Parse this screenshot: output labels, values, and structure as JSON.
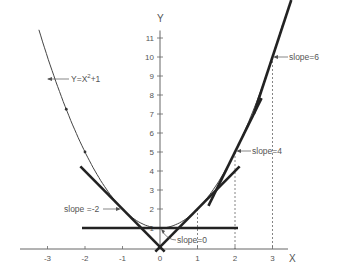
{
  "chart_data": {
    "type": "line",
    "title": "",
    "xlabel": "X",
    "ylabel": "Y",
    "function": "Y=X^2+1",
    "curve_label": "Y=X2+1",
    "xlim": [
      -3.5,
      3.8
    ],
    "ylim": [
      0,
      11.5
    ],
    "x_ticks": [
      -3,
      -2,
      -1,
      0,
      1,
      2,
      3
    ],
    "x_tick_labels": [
      "-3",
      "-2",
      "-1",
      "0",
      "1",
      "2",
      "3"
    ],
    "y_ticks": [
      1,
      2,
      3,
      4,
      5,
      6,
      7,
      8,
      9,
      10,
      11
    ],
    "y_tick_labels": [
      "1",
      "2",
      "3",
      "4",
      "5",
      "6",
      "7",
      "8",
      "9",
      "10",
      "11"
    ],
    "grid": false,
    "series": [
      {
        "name": "Y=X^2+1",
        "x": [
          -3,
          -2.5,
          -2,
          -1.5,
          -1,
          -0.5,
          0,
          0.5,
          1,
          1.5,
          2,
          2.5,
          3
        ],
        "y": [
          10,
          7.25,
          5,
          3.25,
          2,
          1.25,
          1,
          1.25,
          2,
          3.25,
          5,
          7.25,
          10
        ]
      }
    ],
    "tangents": [
      {
        "x": -1,
        "y": 2,
        "slope": -2,
        "label": "slope =-2"
      },
      {
        "x": 0,
        "y": 1,
        "slope": 0,
        "label": "slope=0"
      },
      {
        "x": 1,
        "y": 2,
        "slope": 2,
        "label": ""
      },
      {
        "x": 2,
        "y": 5,
        "slope": 4,
        "label": "slope=4"
      },
      {
        "x": 3,
        "y": 10,
        "slope": 6,
        "label": "slope=6"
      }
    ],
    "dashed_guides": [
      1,
      2,
      3
    ],
    "marked_points": [
      {
        "x": -2.5,
        "y": 7.25
      },
      {
        "x": -2,
        "y": 5
      }
    ]
  },
  "labels": {
    "x_axis": "X",
    "y_axis": "Y",
    "curve": "Y=X",
    "curve_exp": "2",
    "curve_tail": "+1",
    "slope_m2": "slope =-2",
    "slope_0": "slope=0",
    "slope_4": "slope=4",
    "slope_6": "slope=6"
  }
}
